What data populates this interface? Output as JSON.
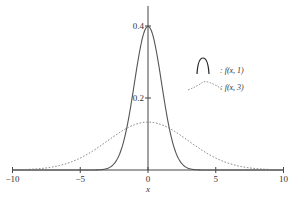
{
  "chart_data": {
    "type": "line",
    "title": "",
    "xlabel": "x",
    "ylabel": "",
    "xlim": [
      -10,
      10
    ],
    "ylim": [
      0,
      0.42
    ],
    "x_ticks": [
      -10,
      -5,
      0,
      5,
      10
    ],
    "x_tick_labels": [
      "−10",
      "−5",
      "0",
      "5",
      "10"
    ],
    "y_ticks": [
      0.2,
      0.4
    ],
    "y_tick_labels": [
      "0.2",
      "0.4"
    ],
    "grid": false,
    "legend_position": "right",
    "series": [
      {
        "name": "f(x, 1)",
        "legend_label": ": f(x,  1)",
        "style": "solid",
        "color": "#555555",
        "sigma": 1,
        "x": [
          -10,
          -5,
          -4,
          -3,
          -2,
          -1,
          0,
          1,
          2,
          3,
          4,
          5,
          10
        ],
        "values": [
          0.0,
          0.0,
          0.0001,
          0.0044,
          0.054,
          0.242,
          0.399,
          0.242,
          0.054,
          0.0044,
          0.0001,
          0.0,
          0.0
        ]
      },
      {
        "name": "f(x, 3)",
        "legend_label": ": f(x,  3)",
        "style": "dotted",
        "color": "#777777",
        "sigma": 3,
        "x": [
          -10,
          -8,
          -6,
          -4,
          -2,
          0,
          2,
          4,
          6,
          8,
          10
        ],
        "values": [
          0.0005,
          0.0038,
          0.018,
          0.055,
          0.106,
          0.133,
          0.106,
          0.055,
          0.018,
          0.0038,
          0.0005
        ]
      }
    ]
  }
}
